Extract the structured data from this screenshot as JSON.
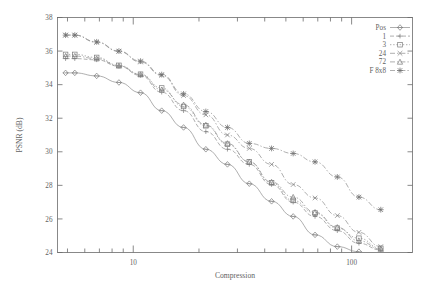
{
  "chart_data": {
    "type": "line",
    "title": "",
    "xlabel": "Compression",
    "ylabel": "PSNR (dB)",
    "xscale": "log",
    "yscale": "linear",
    "xlim": [
      4.5,
      190
    ],
    "ylim": [
      24,
      38
    ],
    "yticks": [
      24,
      26,
      28,
      30,
      32,
      34,
      36,
      38
    ],
    "xticks": [
      10,
      100
    ],
    "xticklabels": [
      "10",
      "100"
    ],
    "grid": false,
    "legend_position": "top-right",
    "series": [
      {
        "name": "Pos",
        "marker": "diamond",
        "linestyle": "solid",
        "x": [
          4.9,
          5.4,
          6.8,
          8.6,
          10.8,
          13.5,
          17.0,
          21.5,
          27.0,
          34.0,
          43.0,
          54.0,
          68.0,
          86.0,
          108.0
        ],
        "values": [
          34.7,
          34.7,
          34.52,
          34.13,
          33.52,
          32.45,
          31.45,
          30.15,
          29.25,
          28.1,
          27.05,
          26.15,
          25.05,
          24.35,
          24.05
        ]
      },
      {
        "name": "1",
        "marker": "plus",
        "linestyle": "dashed",
        "x": [
          4.9,
          5.4,
          6.8,
          8.6,
          10.8,
          13.5,
          17.0,
          21.5,
          27.0,
          34.0,
          43.0,
          54.0,
          68.0,
          86.0,
          108.0,
          136.0
        ],
        "values": [
          35.55,
          35.55,
          35.48,
          35.1,
          34.55,
          33.55,
          32.45,
          31.2,
          30.15,
          29.25,
          28.05,
          27.0,
          26.15,
          25.3,
          24.55,
          24.15
        ]
      },
      {
        "name": "3",
        "marker": "square",
        "linestyle": "dotted",
        "x": [
          4.9,
          5.4,
          6.8,
          8.6,
          10.8,
          13.5,
          17.0,
          21.5,
          27.0,
          34.0,
          43.0,
          54.0,
          68.0,
          86.0,
          108.0,
          136.0
        ],
        "values": [
          35.8,
          35.8,
          35.62,
          35.15,
          34.62,
          33.8,
          32.7,
          31.55,
          30.45,
          29.4,
          28.15,
          27.1,
          26.35,
          25.45,
          24.85,
          24.25
        ]
      },
      {
        "name": "24",
        "marker": "cross",
        "linestyle": "dashdot",
        "x": [
          4.9,
          5.4,
          6.8,
          8.6,
          10.8,
          13.5,
          17.0,
          21.5,
          27.0,
          34.0,
          43.0,
          54.0,
          68.0,
          86.0,
          108.0,
          136.0
        ],
        "values": [
          36.95,
          36.95,
          36.52,
          35.98,
          35.35,
          34.55,
          33.35,
          32.2,
          31.0,
          30.2,
          29.25,
          28.05,
          27.25,
          26.2,
          25.2,
          24.35
        ]
      },
      {
        "name": "72",
        "marker": "triangle",
        "linestyle": "dashdot",
        "x": [
          4.9,
          5.4,
          6.8,
          8.6,
          10.8,
          13.5,
          17.0,
          21.5,
          27.0,
          34.0,
          43.0,
          54.0,
          68.0,
          86.0,
          108.0,
          136.0
        ],
        "values": [
          35.7,
          35.7,
          35.55,
          35.12,
          34.6,
          33.7,
          32.8,
          31.6,
          30.5,
          29.4,
          28.2,
          27.3,
          26.4,
          25.5,
          24.7,
          24.2
        ]
      },
      {
        "name": "F 8x8",
        "marker": "star",
        "linestyle": "dashdot",
        "x": [
          4.9,
          5.4,
          6.8,
          8.6,
          10.8,
          13.5,
          17.0,
          21.5,
          27.0,
          34.0,
          43.0,
          54.0,
          68.0,
          86.0,
          108.0,
          136.0
        ],
        "values": [
          36.95,
          36.95,
          36.55,
          36.0,
          35.4,
          34.6,
          33.45,
          32.4,
          31.45,
          30.5,
          30.2,
          29.9,
          29.4,
          28.5,
          27.3,
          26.55
        ]
      }
    ]
  },
  "legend": {
    "items": [
      {
        "label": "Pos"
      },
      {
        "label": "1"
      },
      {
        "label": "3"
      },
      {
        "label": "24"
      },
      {
        "label": "72"
      },
      {
        "label": "F 8x8"
      }
    ]
  },
  "axes": {
    "x_title": "Compression",
    "y_title": "PSNR (dB)",
    "y_labels": [
      "38",
      "36",
      "34",
      "32",
      "30",
      "28",
      "26",
      "24"
    ],
    "x_labels": [
      "10",
      "100"
    ]
  },
  "colors": {
    "line": "#8d8d8d",
    "axis": "#6b6b6b",
    "text": "#5f5f5f",
    "background": "#ffffff"
  }
}
